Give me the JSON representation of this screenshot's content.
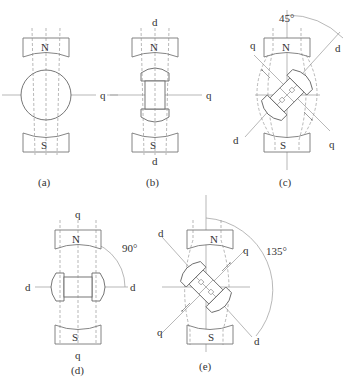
{
  "figure": {
    "poles": {
      "north": "N",
      "south": "S"
    },
    "panels": [
      {
        "id": "a",
        "caption": "(a)",
        "rotor": "round",
        "axis_labels": [
          "q"
        ],
        "angle": null
      },
      {
        "id": "b",
        "caption": "(b)",
        "rotor": "salient",
        "axis_labels": [
          "d",
          "q",
          "d"
        ],
        "angle": "0"
      },
      {
        "id": "c",
        "caption": "(c)",
        "rotor": "salient-rotated",
        "axis_labels": [
          "q",
          "d",
          "d",
          "q"
        ],
        "angle": "45°"
      },
      {
        "id": "d",
        "caption": "(d)",
        "rotor": "salient-horizontal",
        "axis_labels": [
          "q",
          "d",
          "d",
          "q"
        ],
        "angle": "90°"
      },
      {
        "id": "e",
        "caption": "(e)",
        "rotor": "salient-rotated",
        "axis_labels": [
          "d",
          "q",
          "q",
          "d"
        ],
        "angle": "135°"
      }
    ]
  },
  "labels": {
    "a": {
      "q": "q",
      "N": "N",
      "S": "S",
      "caption": "(a)"
    },
    "b": {
      "d_top": "d",
      "q": "q",
      "d_bottom": "d",
      "N": "N",
      "S": "S",
      "caption": "(b)"
    },
    "c": {
      "angle": "45°",
      "q_left": "q",
      "d_right": "d",
      "d_left": "d",
      "q_right": "q",
      "N": "N",
      "S": "S",
      "caption": "(c)"
    },
    "d": {
      "q_top": "q",
      "angle": "90°",
      "d_left": "d",
      "d_right": "d",
      "q_bottom": "q",
      "N": "N",
      "S": "S",
      "caption": "(d)"
    },
    "e": {
      "d_left": "d",
      "q_right": "q",
      "angle": "135°",
      "q_left": "q",
      "d_right": "d",
      "N": "N",
      "S": "S",
      "caption": "(e)"
    }
  }
}
